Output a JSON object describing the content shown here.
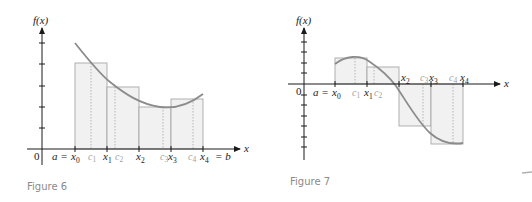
{
  "figure6": {
    "caption": "Figure 6",
    "y_axis_label": "f(x)",
    "x_axis_label": "x",
    "origin_label": "0",
    "left_label": "a =",
    "right_label": "= b",
    "partition_labels": [
      "x",
      "x",
      "x",
      "x",
      "x"
    ],
    "partition_subs": [
      "0",
      "1",
      "2",
      "3",
      "4"
    ],
    "sample_labels": [
      "c",
      "c",
      "c",
      "c"
    ],
    "sample_subs": [
      "1",
      "2",
      "3",
      "4"
    ]
  },
  "figure7": {
    "caption": "Figure 7",
    "y_axis_label": "f(x)",
    "x_axis_label": "x",
    "origin_label": "0",
    "left_label": "a =",
    "partition_labels": [
      "x",
      "x",
      "x",
      "x",
      "x"
    ],
    "partition_subs": [
      "0",
      "1",
      "2",
      "3",
      "4"
    ],
    "sample_labels": [
      "c",
      "c",
      "c",
      "c"
    ],
    "sample_subs": [
      "1",
      "2",
      "3",
      "4"
    ]
  },
  "colors": {
    "axis": "#1a1a1a",
    "rectangle_fill": "#f1f1f1",
    "rectangle_stroke": "#a8a8a8",
    "curve": "#8c8c8c",
    "sample_label": "#a0a0a0",
    "caption": "#8a8a8a"
  }
}
